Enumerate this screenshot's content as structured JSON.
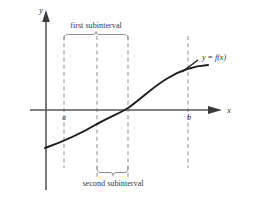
{
  "figure": {
    "background_color": "#ffffff"
  },
  "axes": {
    "y_axis_label": "y",
    "x_axis_label": "x",
    "axis_color": "#58585a",
    "origin_x": 46,
    "origin_y": 110,
    "x_axis_start": 30,
    "x_axis_end": 222,
    "y_axis_top": 14,
    "y_axis_bottom": 190
  },
  "curve": {
    "label": "y = f(x)",
    "color": "#1c1c1c",
    "shape": "increasing-sigmoid",
    "points": [
      {
        "x": 45,
        "y": 148
      },
      {
        "x": 64,
        "y": 140
      },
      {
        "x": 80,
        "y": 132
      },
      {
        "x": 97,
        "y": 124
      },
      {
        "x": 112,
        "y": 118
      },
      {
        "x": 128,
        "y": 108
      },
      {
        "x": 145,
        "y": 95
      },
      {
        "x": 162,
        "y": 82
      },
      {
        "x": 178,
        "y": 73
      },
      {
        "x": 195,
        "y": 68
      },
      {
        "x": 208,
        "y": 66
      }
    ]
  },
  "boundaries": {
    "left_label": "a",
    "right_label": "b",
    "dashed_color": "#9a9a9c",
    "lines": [
      {
        "name": "a-boundary",
        "x": 64,
        "y_top": 36,
        "y_bottom": 168
      },
      {
        "name": "x1-boundary",
        "x": 97,
        "y_top": 36,
        "y_bottom": 178
      },
      {
        "name": "x2-boundary",
        "x": 128,
        "y_top": 36,
        "y_bottom": 178
      },
      {
        "name": "b-boundary",
        "x": 188,
        "y_top": 36,
        "y_bottom": 168
      }
    ]
  },
  "annotations": {
    "first_subinterval_label": "first subinterval",
    "second_subinterval_label": "second subinterval",
    "brace_color": "#8e8e90"
  }
}
